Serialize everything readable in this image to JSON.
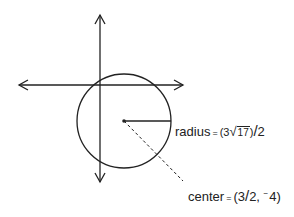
{
  "diagram": {
    "type": "circle-on-axes",
    "axes": {
      "x_axis": "horizontal line with arrows both ends",
      "y_axis": "vertical line with arrows both ends"
    },
    "circle": {
      "center_label": "center",
      "radius_label": "radius"
    },
    "radius_text": {
      "name": "radius",
      "equals": "=",
      "open": "(3",
      "sqrt_symbol": "√",
      "sqrt_value": "17",
      "close": ")",
      "slash": "/",
      "denominator": "2"
    },
    "center_text": {
      "name": "center",
      "equals": "=",
      "open": "(3",
      "slash": "/",
      "x_denominator": "2,",
      "neg_sign": "−",
      "y_value": "4)"
    },
    "colors": {
      "stroke": "#222222",
      "background": "#ffffff"
    }
  }
}
